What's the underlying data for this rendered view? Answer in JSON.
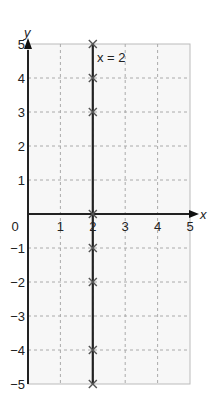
{
  "chart_data": {
    "type": "line",
    "title": "",
    "xlabel": "x",
    "ylabel": "y",
    "xlim": [
      0,
      5
    ],
    "ylim": [
      -5,
      5
    ],
    "grid": true,
    "x_ticks": [
      "0",
      "1",
      "2",
      "3",
      "4",
      "5"
    ],
    "y_ticks": [
      "5",
      "4",
      "3",
      "2",
      "1",
      "-1",
      "-2",
      "-3",
      "-4",
      "-5"
    ],
    "y_tick_labels": [
      "5",
      "4",
      "3",
      "2",
      "1",
      "−1",
      "−2",
      "−3",
      "−4",
      "−5"
    ],
    "series": [
      {
        "name": "x = 2",
        "type": "vertical-line",
        "x": 2,
        "marked_points": [
          [
            2,
            5
          ],
          [
            2,
            4
          ],
          [
            2,
            3
          ],
          [
            2,
            0
          ],
          [
            2,
            -1
          ],
          [
            2,
            -2
          ],
          [
            2,
            -4
          ],
          [
            2,
            -5
          ]
        ]
      }
    ],
    "annotations": [
      {
        "text": "x = 2",
        "x": 2,
        "y": 5
      }
    ]
  }
}
